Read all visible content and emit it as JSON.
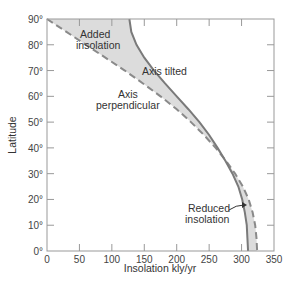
{
  "chart_data": {
    "type": "line",
    "title": "",
    "xlabel": "Insolation kly/yr",
    "ylabel": "Latitude",
    "xlim": [
      0,
      350
    ],
    "ylim": [
      0,
      90
    ],
    "x_ticks": [
      "0",
      "50",
      "100",
      "150",
      "200",
      "250",
      "300",
      "350"
    ],
    "y_ticks": [
      "0°",
      "10°",
      "20°",
      "30°",
      "40°",
      "50°",
      "60°",
      "70°",
      "80°",
      "90°"
    ],
    "grid": false,
    "legend": null,
    "series": [
      {
        "name": "Axis tilted",
        "style": "solid",
        "color": "#777777",
        "points": [
          [
            127,
            90
          ],
          [
            130,
            85
          ],
          [
            138,
            80
          ],
          [
            150,
            75
          ],
          [
            165,
            70
          ],
          [
            182,
            65
          ],
          [
            200,
            60
          ],
          [
            218,
            55
          ],
          [
            235,
            50
          ],
          [
            250,
            45
          ],
          [
            263,
            40
          ],
          [
            275,
            35
          ],
          [
            286,
            30
          ],
          [
            295,
            25
          ],
          [
            301,
            20
          ],
          [
            305,
            15
          ],
          [
            308,
            10
          ],
          [
            309,
            5
          ],
          [
            310,
            0
          ]
        ]
      },
      {
        "name": "Axis perpendicular",
        "style": "dashed",
        "color": "#888888",
        "points": [
          [
            0,
            90
          ],
          [
            30,
            85
          ],
          [
            60,
            80
          ],
          [
            90,
            75
          ],
          [
            120,
            70
          ],
          [
            148,
            65
          ],
          [
            175,
            60
          ],
          [
            200,
            55
          ],
          [
            222,
            50
          ],
          [
            242,
            45
          ],
          [
            260,
            40
          ],
          [
            276,
            35
          ],
          [
            290,
            30
          ],
          [
            302,
            25
          ],
          [
            311,
            20
          ],
          [
            317,
            15
          ],
          [
            321,
            10
          ],
          [
            323,
            5
          ],
          [
            324,
            0
          ]
        ]
      }
    ],
    "annotations": [
      {
        "text": [
          "Added",
          "insolation"
        ],
        "at": [
          90,
          83
        ]
      },
      {
        "text": [
          "Axis tilted"
        ],
        "at": [
          190,
          68
        ]
      },
      {
        "text": [
          "Axis",
          "perpendicular"
        ],
        "at": [
          155,
          58
        ]
      },
      {
        "text": [
          "Reduced",
          "insolation"
        ],
        "at": [
          255,
          17
        ],
        "arrow_to": [
          303,
          22
        ]
      }
    ],
    "shaded_regions": [
      {
        "label": "Added insolation",
        "between": [
          "Axis perpendicular",
          "Axis tilted"
        ],
        "lat_range": [
          47,
          90
        ]
      },
      {
        "label": "Reduced insolation",
        "between": [
          "Axis tilted",
          "Axis perpendicular"
        ],
        "lat_range": [
          0,
          47
        ]
      }
    ]
  },
  "labels": {
    "x_title": "Insolation kly/yr",
    "y_title": "Latitude",
    "x_ticks": [
      "0",
      "50",
      "100",
      "150",
      "200",
      "250",
      "300",
      "350"
    ],
    "y_ticks": [
      "0°",
      "10°",
      "20°",
      "30°",
      "40°",
      "50°",
      "60°",
      "70°",
      "80°",
      "90°"
    ],
    "added_1": "Added",
    "added_2": "insolation",
    "tilted": "Axis tilted",
    "perp_1": "Axis",
    "perp_2": "perpendicular",
    "reduced_1": "Reduced",
    "reduced_2": "insolation"
  }
}
